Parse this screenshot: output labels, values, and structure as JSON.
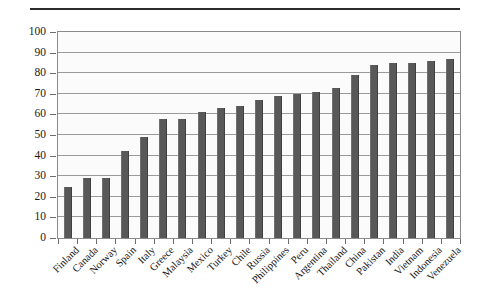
{
  "chart_data": {
    "type": "bar",
    "title": "",
    "subtitle": "",
    "xlabel": "",
    "ylabel": "",
    "ylim": [
      0,
      100
    ],
    "yticks": [
      0,
      10,
      20,
      30,
      40,
      50,
      60,
      70,
      80,
      90,
      100
    ],
    "grid": true,
    "legend": false,
    "legend_position": "none",
    "orientation": "vertical",
    "bar_color": "#585858",
    "plot_background": "#fbfbfb",
    "axis_color": "#8a8a8a",
    "categories": [
      "Finland",
      "Canada",
      "Norway",
      "Spain",
      "Italy",
      "Greece",
      "Malaysia",
      "Mexico",
      "Turkey",
      "Chile",
      "Russia",
      "Philippines",
      "Peru",
      "Argentina",
      "Thailand",
      "China",
      "Pakistan",
      "India",
      "Vietnam",
      "Indonesia",
      "Venezuela"
    ],
    "values": [
      25,
      29,
      29,
      42,
      49,
      58,
      58,
      61,
      63,
      64,
      67,
      69,
      70,
      71,
      73,
      79,
      84,
      85,
      85,
      86,
      87
    ],
    "series": [
      {
        "name": "Value",
        "values": [
          25,
          29,
          29,
          42,
          49,
          58,
          58,
          61,
          63,
          64,
          67,
          69,
          70,
          71,
          73,
          79,
          84,
          85,
          85,
          86,
          87
        ]
      }
    ]
  },
  "figure": {
    "top_rule": "horizontal-rule"
  }
}
